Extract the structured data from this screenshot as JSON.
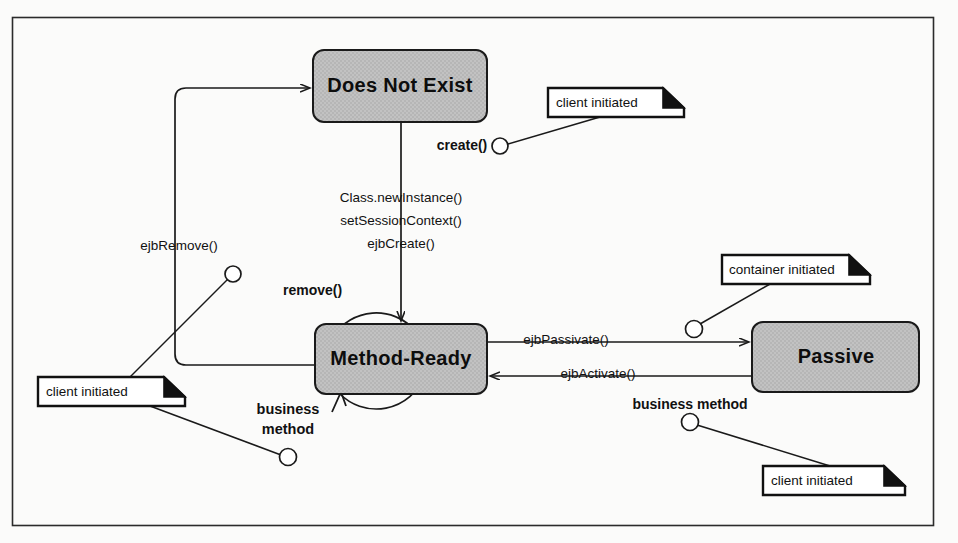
{
  "diagram": {
    "frame": {
      "border_color": "#2b2b2b",
      "background": "#fbfbfa"
    },
    "states": [
      {
        "id": "does-not-exist",
        "label": "Does Not  Exist",
        "x": 313,
        "y": 50,
        "w": 174,
        "h": 72,
        "fill": "#bfbfbf",
        "stroke": "#1a1a1a"
      },
      {
        "id": "method-ready",
        "label": "Method-Ready",
        "x": 315,
        "y": 324,
        "w": 172,
        "h": 70,
        "fill": "#bfbfbf",
        "stroke": "#1a1a1a"
      },
      {
        "id": "passive",
        "label": "Passive",
        "x": 752,
        "y": 322,
        "w": 167,
        "h": 70,
        "fill": "#bfbfbf",
        "stroke": "#1a1a1a"
      }
    ],
    "transitions": [
      {
        "id": "create",
        "label": "create()",
        "bold": true,
        "from": "client",
        "to": "does-not-exist"
      },
      {
        "id": "instantiate",
        "label_lines": [
          "Class.newInstance()",
          "setSessionContext()",
          "ejbCreate()"
        ],
        "from": "does-not-exist",
        "to": "method-ready"
      },
      {
        "id": "ejb-remove",
        "label": "ejbRemove()",
        "bold": false,
        "from": "method-ready",
        "to": "does-not-exist"
      },
      {
        "id": "remove",
        "label": "remove()",
        "bold": true,
        "from": "client",
        "to": "ejb-remove"
      },
      {
        "id": "ejb-passivate",
        "label": "ejbPassivate()",
        "bold": false,
        "from": "method-ready",
        "to": "passive"
      },
      {
        "id": "ejb-activate",
        "label": "ejbActivate()",
        "bold": false,
        "from": "passive",
        "to": "method-ready"
      },
      {
        "id": "business-method-loop",
        "label_lines": [
          "business",
          "method"
        ],
        "bold": true,
        "from": "method-ready",
        "to": "method-ready"
      },
      {
        "id": "business-method-passive",
        "label": "business method",
        "bold": true,
        "from": "client",
        "to": "passive"
      }
    ],
    "notes": [
      {
        "id": "note-create",
        "text": "client initiated",
        "x": 548,
        "y": 88,
        "w": 136,
        "h": 29
      },
      {
        "id": "note-passivate",
        "text": "container initiated",
        "x": 722,
        "y": 255,
        "w": 148,
        "h": 29
      },
      {
        "id": "note-remove",
        "text": "client initiated",
        "x": 38,
        "y": 377,
        "w": 147,
        "h": 29
      },
      {
        "id": "note-business",
        "text": "client initiated",
        "x": 763,
        "y": 466,
        "w": 142,
        "h": 29
      }
    ]
  }
}
